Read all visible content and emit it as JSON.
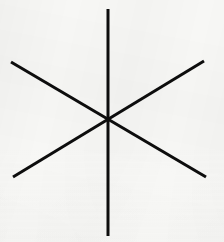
{
  "figure": {
    "name": "six-pointed-asterisk",
    "canvas": {
      "width": 224,
      "height": 242,
      "background_color": "#f7f7f5",
      "paper_tone": "off-white scanned paper"
    },
    "stroke": {
      "color": "#0d0d0d",
      "width": 3,
      "linecap": "butt"
    },
    "center": {
      "x": 108,
      "y": 119
    },
    "line_count": 3,
    "ray_count": 6,
    "angle_between_rays_degrees": 60,
    "lines": [
      {
        "name": "vertical-line",
        "orientation": "vertical",
        "x1": 108,
        "y1": 9,
        "x2": 108,
        "y2": 236,
        "angle_degrees": 90
      },
      {
        "name": "diagonal-nw-se-line",
        "orientation": "diagonal descending",
        "x1": 11,
        "y1": 62,
        "x2": 206,
        "y2": 177,
        "angle_degrees": -30
      },
      {
        "name": "diagonal-sw-ne-line",
        "orientation": "diagonal ascending",
        "x1": 13,
        "y1": 177,
        "x2": 204,
        "y2": 61,
        "angle_degrees": 30
      }
    ]
  }
}
